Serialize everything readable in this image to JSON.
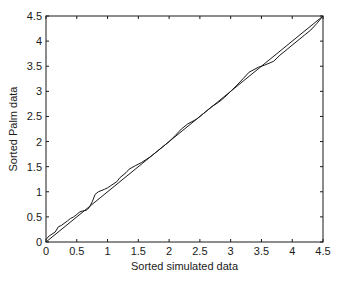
{
  "chart_data": {
    "type": "line",
    "title": "",
    "xlabel": "Sorted simulated data",
    "ylabel": "Sorted Palm data",
    "xlim": [
      0,
      4.5
    ],
    "ylim": [
      0,
      4.5
    ],
    "xticks": [
      0,
      0.5,
      1,
      1.5,
      2,
      2.5,
      3,
      3.5,
      4,
      4.5
    ],
    "yticks": [
      0,
      0.5,
      1,
      1.5,
      2,
      2.5,
      3,
      3.5,
      4,
      4.5
    ],
    "xtick_labels": [
      "0",
      "0.5",
      "1",
      "1.5",
      "2",
      "2.5",
      "3",
      "3.5",
      "4",
      "4.5"
    ],
    "ytick_labels": [
      "0",
      "0.5",
      "1",
      "1.5",
      "2",
      "2.5",
      "3",
      "3.5",
      "4",
      "4.5"
    ],
    "grid": false,
    "legend": null,
    "series": [
      {
        "name": "Q-Q plot",
        "x": [
          0,
          0.05,
          0.15,
          0.2,
          0.25,
          0.35,
          0.4,
          0.45,
          0.5,
          0.55,
          0.6,
          0.65,
          0.7,
          0.75,
          0.8,
          0.85,
          0.95,
          1.0,
          1.05,
          1.15,
          1.2,
          1.3,
          1.35,
          1.45,
          1.55,
          1.7,
          1.8,
          1.9,
          2.0,
          2.1,
          2.2,
          2.3,
          2.45,
          2.55,
          2.7,
          2.8,
          2.9,
          3.0,
          3.1,
          3.2,
          3.3,
          3.45,
          3.55,
          3.7,
          3.8,
          3.9,
          4.0,
          4.1,
          4.2,
          4.3,
          4.4,
          4.5
        ],
        "y": [
          0.05,
          0.12,
          0.2,
          0.3,
          0.33,
          0.42,
          0.47,
          0.5,
          0.55,
          0.6,
          0.62,
          0.63,
          0.68,
          0.8,
          0.95,
          1.0,
          1.05,
          1.08,
          1.12,
          1.2,
          1.28,
          1.38,
          1.45,
          1.52,
          1.58,
          1.7,
          1.8,
          1.9,
          2.0,
          2.12,
          2.25,
          2.35,
          2.45,
          2.55,
          2.7,
          2.78,
          2.88,
          3.0,
          3.12,
          3.25,
          3.38,
          3.48,
          3.52,
          3.6,
          3.72,
          3.82,
          3.92,
          4.02,
          4.12,
          4.22,
          4.35,
          4.5
        ]
      },
      {
        "name": "Reference line y=x",
        "x": [
          0,
          4.5
        ],
        "y": [
          0,
          4.5
        ]
      }
    ]
  }
}
